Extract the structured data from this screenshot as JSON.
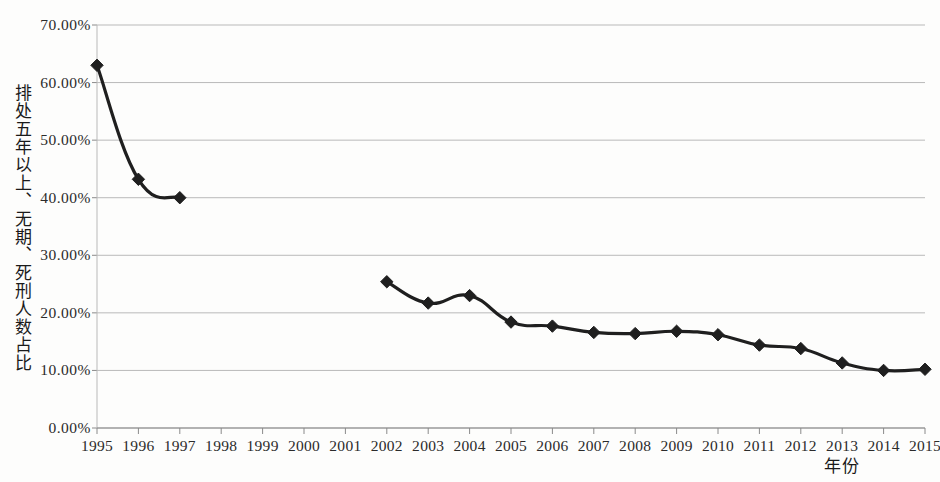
{
  "chart_data": {
    "type": "line",
    "title": "",
    "xlabel": "年份",
    "ylabel": "排处五年以上、无期、死刑人数占比",
    "x": [
      1995,
      1996,
      1997,
      1998,
      1999,
      2000,
      2001,
      2002,
      2003,
      2004,
      2005,
      2006,
      2007,
      2008,
      2009,
      2010,
      2011,
      2012,
      2013,
      2014,
      2015
    ],
    "xtick_labels": [
      "1995",
      "1996",
      "1997",
      "1998",
      "1999",
      "2000",
      "2001",
      "2002",
      "2003",
      "2004",
      "2005",
      "2006",
      "2007",
      "2008",
      "2009",
      "2010",
      "2011",
      "2012",
      "2013",
      "2014",
      "2015"
    ],
    "ytick_labels": [
      "0.00%",
      "10.00%",
      "20.00%",
      "30.00%",
      "40.00%",
      "50.00%",
      "60.00%",
      "70.00%"
    ],
    "ytick_values": [
      0,
      10,
      20,
      30,
      40,
      50,
      60,
      70
    ],
    "ylim": [
      0,
      70
    ],
    "xlim": [
      1995,
      2015
    ],
    "grid": true,
    "legend": false,
    "series": [
      {
        "name": "排处五年以上、无期、死刑人数占比",
        "marker": "diamond",
        "color": "#1f1f1f",
        "values": [
          63.0,
          43.2,
          40.0,
          null,
          null,
          null,
          null,
          25.4,
          21.7,
          23.0,
          18.4,
          17.7,
          16.6,
          16.4,
          16.8,
          16.2,
          14.4,
          13.8,
          11.3,
          10.0,
          10.2
        ]
      }
    ]
  },
  "style": {
    "background": "#fdfdfc",
    "line_color": "#1f1f1f",
    "grid_color": "#b9b9b9",
    "axis_color": "#8a8a8a",
    "text_color": "#2b2b2b"
  }
}
